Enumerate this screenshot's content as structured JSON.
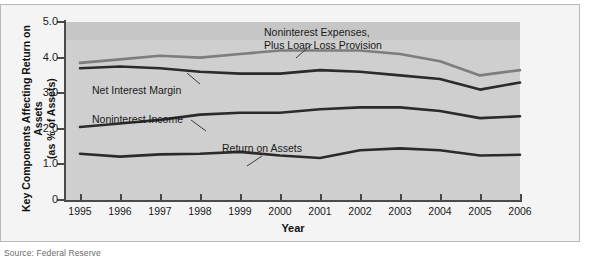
{
  "figure": {
    "source_note": "Source: Federal Reserve"
  },
  "chart_data": {
    "type": "line",
    "title": "",
    "xlabel": "Year",
    "ylabel": "Key Components Affecting Return on Assets (as % of Assets)",
    "ylabel_line1": "Key Components Affecting Return on Assets",
    "ylabel_line2": "(as % of Assets)",
    "categories": [
      "1995",
      "1996",
      "1997",
      "1998",
      "1999",
      "2000",
      "2001",
      "2002",
      "2003",
      "2004",
      "2005",
      "2006"
    ],
    "x": [
      1995,
      1996,
      1997,
      1998,
      1999,
      2000,
      2001,
      2002,
      2003,
      2004,
      2005,
      2006
    ],
    "xlim": [
      1995,
      2006
    ],
    "ylim": [
      0,
      5.0
    ],
    "yticks": [
      "0",
      "1.0",
      "2.0",
      "3.0",
      "4.0",
      "5.0"
    ],
    "ytick_values": [
      0,
      1.0,
      2.0,
      3.0,
      4.0,
      5.0
    ],
    "grid": false,
    "legend": "annotations",
    "series": [
      {
        "name": "Noninterest Expenses, Plus Loan Loss Provision",
        "label_line1": "Noninterest Expenses,",
        "label_line2": "Plus Loan Loss Provision",
        "color": "#7d7d7d",
        "values": [
          3.85,
          3.95,
          4.05,
          4.0,
          4.1,
          4.2,
          4.2,
          4.2,
          4.1,
          3.9,
          3.5,
          3.65
        ]
      },
      {
        "name": "Net Interest Margin",
        "label_line1": "Net Interest Margin",
        "color": "#2b2b2b",
        "values": [
          3.7,
          3.75,
          3.7,
          3.6,
          3.55,
          3.55,
          3.65,
          3.6,
          3.5,
          3.4,
          3.1,
          3.3
        ]
      },
      {
        "name": "Noninterest Income",
        "label_line1": "Noninterest Income",
        "color": "#2b2b2b",
        "values": [
          2.05,
          2.15,
          2.25,
          2.4,
          2.45,
          2.45,
          2.55,
          2.6,
          2.6,
          2.5,
          2.3,
          2.35
        ]
      },
      {
        "name": "Return on Assets",
        "label_line1": "Return on Assets",
        "color": "#2b2b2b",
        "values": [
          1.3,
          1.22,
          1.28,
          1.3,
          1.35,
          1.25,
          1.18,
          1.4,
          1.45,
          1.4,
          1.25,
          1.27
        ]
      }
    ]
  }
}
